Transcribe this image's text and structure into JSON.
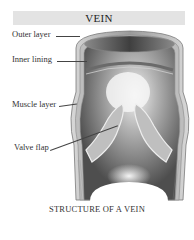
{
  "title": "VEIN",
  "caption": "STRUCTURE OF A VEIN",
  "labels": [
    {
      "text": "Outer layer"
    },
    {
      "text": "Inner lining"
    },
    {
      "text": "Muscle layer"
    },
    {
      "text": "Valve flap"
    }
  ],
  "colors": {
    "title_bar": "#e3e3e3",
    "vein_dark": "#5a5a5a",
    "vein_light": "#f2f2f2",
    "wall_stroke": "#7a7a7a"
  }
}
